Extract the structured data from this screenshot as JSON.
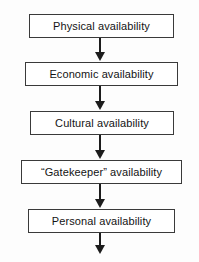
{
  "diagram": {
    "orientation": "vertical-top-down",
    "stroke_color": "#3a3a3a",
    "fill_color": "#ffffff",
    "arrow_color": "#1c1c1c",
    "background_color": "#fdfdfd",
    "nodes": [
      {
        "id": "physical",
        "label": "Physical availability",
        "left": 29,
        "top": 14,
        "width": 145,
        "height": 24
      },
      {
        "id": "economic",
        "label": "Economic availability",
        "left": 25,
        "top": 62,
        "width": 153,
        "height": 24
      },
      {
        "id": "cultural",
        "label": "Cultural availability",
        "left": 30,
        "top": 111,
        "width": 144,
        "height": 24
      },
      {
        "id": "gatekeeper",
        "label": "“Gatekeeper” availability",
        "left": 21,
        "top": 160,
        "width": 161,
        "height": 24
      },
      {
        "id": "personal",
        "label": "Personal availability",
        "left": 28,
        "top": 209,
        "width": 147,
        "height": 24
      }
    ],
    "connectors": [
      {
        "id": "physical-to-economic",
        "from": "physical",
        "to": "economic",
        "left": 92,
        "top": 38,
        "stem_height": 14,
        "glyph": "down-arrow-icon"
      },
      {
        "id": "economic-to-cultural",
        "from": "economic",
        "to": "cultural",
        "left": 92,
        "top": 86,
        "stem_height": 15,
        "glyph": "down-arrow-icon"
      },
      {
        "id": "cultural-to-gatekeeper",
        "from": "cultural",
        "to": "gatekeeper",
        "left": 92,
        "top": 135,
        "stem_height": 15,
        "glyph": "down-arrow-icon"
      },
      {
        "id": "gatekeeper-to-personal",
        "from": "gatekeeper",
        "to": "personal",
        "left": 92,
        "top": 184,
        "stem_height": 15,
        "glyph": "down-arrow-icon"
      },
      {
        "id": "personal-to-outflow",
        "from": "personal",
        "to": null,
        "left": 92,
        "top": 233,
        "stem_height": 12,
        "glyph": "down-arrow-icon"
      }
    ]
  }
}
